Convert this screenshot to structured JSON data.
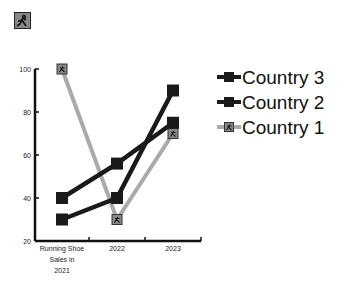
{
  "chart_data": {
    "type": "line",
    "title": "",
    "xlabel": "",
    "ylabel": "",
    "categories": [
      "Running Shoe Sales in 2021",
      "2022",
      "2023"
    ],
    "category_lines": [
      [
        "Running Shoe",
        "Sales in",
        "2021"
      ],
      [
        "2022"
      ],
      [
        "2023"
      ]
    ],
    "ylim": [
      20,
      100
    ],
    "yticks": [
      20,
      40,
      60,
      80,
      100
    ],
    "grid": false,
    "legend_position": "right",
    "series": [
      {
        "name": "Country 3",
        "values": [
          40,
          56,
          75
        ],
        "color": "#1a1a1a",
        "marker": "square"
      },
      {
        "name": "Country 2",
        "values": [
          30,
          40,
          90
        ],
        "color": "#1a1a1a",
        "marker": "square"
      },
      {
        "name": "Country 1",
        "values": [
          100,
          30,
          70
        ],
        "color": "#aaaaaa",
        "marker": "runner-square"
      }
    ]
  },
  "logo": {
    "icon": "runner-icon"
  }
}
